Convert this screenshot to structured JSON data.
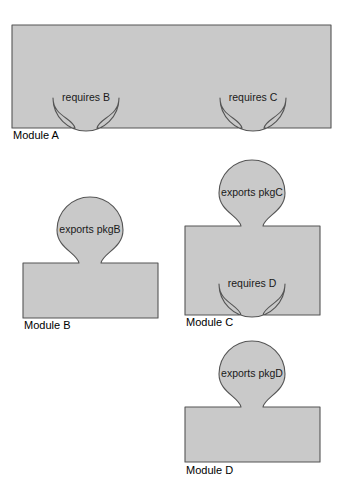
{
  "diagram": {
    "type": "module-dependency-jigsaw",
    "title": "",
    "background_color": "#ffffff",
    "shape_fill": "#c9c9c9",
    "shape_stroke": "#555555",
    "label_color": "#1a1a1a",
    "caption_color": "#000000",
    "modules": [
      {
        "id": "module-a",
        "caption": "Module A",
        "caption_x": 13,
        "caption_y": 131,
        "body": {
          "x": 12,
          "y": 25,
          "width": 319,
          "height": 103
        },
        "ports": [
          {
            "id": "a-requires-b",
            "kind": "socket",
            "edge": "bottom",
            "label": "requires B",
            "cx": 86,
            "cy": 98,
            "r": 33,
            "neck_half_width": 11
          },
          {
            "id": "a-requires-c",
            "kind": "socket",
            "edge": "bottom",
            "label": "requires C",
            "cx": 253,
            "cy": 98,
            "r": 33,
            "neck_half_width": 11
          }
        ]
      },
      {
        "id": "module-b",
        "caption": "Module B",
        "caption_x": 24,
        "caption_y": 321,
        "body": {
          "x": 23,
          "y": 263,
          "width": 135,
          "height": 55
        },
        "ports": [
          {
            "id": "b-exports-pkgb",
            "kind": "tab",
            "edge": "top",
            "label": "exports pkgB",
            "cx": 90,
            "cy": 230,
            "r": 33,
            "neck_half_width": 11
          }
        ]
      },
      {
        "id": "module-c",
        "caption": "Module C",
        "caption_x": 186,
        "caption_y": 318,
        "body": {
          "x": 185,
          "y": 226,
          "width": 135,
          "height": 89
        },
        "ports": [
          {
            "id": "c-exports-pkgc",
            "kind": "tab",
            "edge": "top",
            "label": "exports pkgC",
            "cx": 252,
            "cy": 193,
            "r": 33,
            "neck_half_width": 11
          },
          {
            "id": "c-requires-d",
            "kind": "socket",
            "edge": "bottom",
            "label": "requires D",
            "cx": 252,
            "cy": 284,
            "r": 33,
            "neck_half_width": 11
          }
        ]
      },
      {
        "id": "module-d",
        "caption": "Module D",
        "caption_x": 186,
        "caption_y": 466,
        "body": {
          "x": 185,
          "y": 407,
          "width": 135,
          "height": 55
        },
        "ports": [
          {
            "id": "d-exports-pkgd",
            "kind": "tab",
            "edge": "top",
            "label": "exports pkgD",
            "cx": 252,
            "cy": 374,
            "r": 33,
            "neck_half_width": 11
          }
        ]
      }
    ]
  }
}
